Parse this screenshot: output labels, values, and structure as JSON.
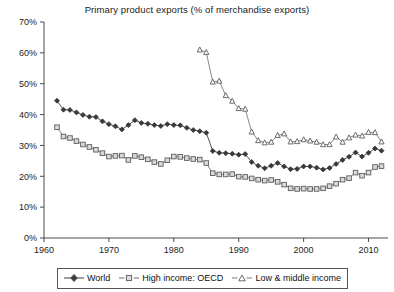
{
  "chart_data": {
    "type": "line",
    "title": "Primary product exports (% of merchandise exports)",
    "xlabel": "",
    "ylabel": "",
    "xlim": [
      1960,
      2013
    ],
    "ylim": [
      0,
      70
    ],
    "xticks": [
      1960,
      1970,
      1980,
      1990,
      2000,
      2010
    ],
    "xtick_labels": [
      "1960",
      "1970",
      "1980",
      "1990",
      "2000",
      "2010"
    ],
    "yticks": [
      0,
      10,
      20,
      30,
      40,
      50,
      60,
      70
    ],
    "ytick_labels": [
      "0%",
      "10%",
      "20%",
      "30%",
      "40%",
      "50%",
      "60%",
      "70%"
    ],
    "grid": false,
    "legend_position": "bottom",
    "series": [
      {
        "name": "World",
        "marker": "filled-diamond",
        "color": "#3d3d3d",
        "x": [
          1962,
          1963,
          1964,
          1965,
          1966,
          1967,
          1968,
          1969,
          1970,
          1971,
          1972,
          1973,
          1974,
          1975,
          1976,
          1977,
          1978,
          1979,
          1980,
          1981,
          1982,
          1983,
          1984,
          1985,
          1986,
          1987,
          1988,
          1989,
          1990,
          1991,
          1992,
          1993,
          1994,
          1995,
          1996,
          1997,
          1998,
          1999,
          2000,
          2001,
          2002,
          2003,
          2004,
          2005,
          2006,
          2007,
          2008,
          2009,
          2010,
          2011,
          2012
        ],
        "y": [
          44.5,
          41.6,
          41.5,
          40.7,
          39.9,
          39.3,
          39.2,
          37.8,
          36.9,
          36.2,
          35.2,
          36.6,
          38.2,
          37.3,
          37.0,
          36.6,
          36.3,
          36.9,
          36.6,
          36.5,
          35.7,
          35.0,
          34.6,
          34.1,
          28.2,
          27.6,
          27.5,
          27.3,
          27.0,
          27.2,
          24.6,
          23.4,
          22.6,
          23.4,
          24.3,
          23.2,
          22.3,
          22.4,
          23.2,
          23.2,
          22.8,
          22.2,
          22.7,
          24.0,
          25.3,
          26.3,
          27.7,
          26.4,
          27.6,
          29.0,
          28.3
        ]
      },
      {
        "name": "High income: OECD",
        "marker": "open-square",
        "color": "#6e6e6e",
        "x": [
          1962,
          1963,
          1964,
          1965,
          1966,
          1967,
          1968,
          1969,
          1970,
          1971,
          1972,
          1973,
          1974,
          1975,
          1976,
          1977,
          1978,
          1979,
          1980,
          1981,
          1982,
          1983,
          1984,
          1985,
          1986,
          1987,
          1988,
          1989,
          1990,
          1991,
          1992,
          1993,
          1994,
          1995,
          1996,
          1997,
          1998,
          1999,
          2000,
          2001,
          2002,
          2003,
          2004,
          2005,
          2006,
          2007,
          2008,
          2009,
          2010,
          2011,
          2012
        ],
        "y": [
          35.9,
          32.9,
          32.4,
          31.4,
          30.3,
          29.5,
          28.6,
          27.5,
          26.4,
          26.6,
          26.7,
          25.3,
          26.6,
          26.2,
          25.5,
          24.6,
          24.0,
          25.2,
          26.4,
          26.3,
          25.9,
          25.6,
          25.4,
          24.3,
          21.0,
          20.6,
          20.6,
          20.7,
          19.9,
          19.8,
          19.3,
          18.9,
          18.6,
          18.8,
          18.2,
          17.3,
          16.1,
          15.9,
          16.0,
          15.9,
          15.9,
          16.1,
          16.8,
          17.6,
          18.9,
          19.4,
          21.2,
          20.2,
          21.2,
          23.0,
          23.3
        ]
      },
      {
        "name": "Low & middle income",
        "marker": "open-triangle",
        "color": "#7a7a7a",
        "x": [
          1984,
          1985,
          1986,
          1987,
          1988,
          1989,
          1990,
          1991,
          1992,
          1993,
          1994,
          1995,
          1996,
          1997,
          1998,
          1999,
          2000,
          2001,
          2002,
          2003,
          2004,
          2005,
          2006,
          2007,
          2008,
          2009,
          2010,
          2011,
          2012
        ],
        "y": [
          61.0,
          60.2,
          50.6,
          50.9,
          46.2,
          44.4,
          42.0,
          41.8,
          34.4,
          31.6,
          30.9,
          31.1,
          33.3,
          33.8,
          31.2,
          31.3,
          31.9,
          31.5,
          31.1,
          30.3,
          30.3,
          32.8,
          31.1,
          32.5,
          33.4,
          33.1,
          34.3,
          34.2,
          31.2
        ]
      }
    ]
  },
  "legend": {
    "items": [
      {
        "label": "World"
      },
      {
        "label": "High income: OECD"
      },
      {
        "label": "Low & middle income"
      }
    ]
  }
}
